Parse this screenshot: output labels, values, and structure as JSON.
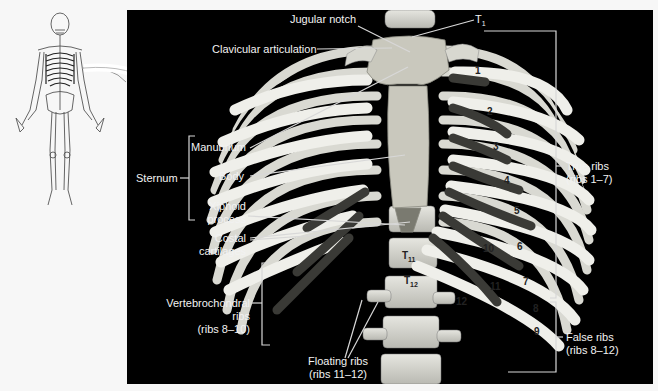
{
  "figure": {
    "panel_bg": "#000000",
    "page_bg": "#f7f7f7",
    "label_color": "#f2f2f2",
    "leader_color": "#d8d8d8"
  },
  "labels": {
    "jugular_notch": "Jugular notch",
    "t1": "T",
    "t1_sub": "1",
    "clavicular_articulation": "Clavicular articulation",
    "sternum": "Sternum",
    "manubrium": "Manubrium",
    "body": "Body",
    "xiphoid_line1": "Xiphoid",
    "xiphoid_line2": "process",
    "costal_line1": "Costal",
    "costal_line2": "cartilages",
    "vertebrochondral_line1": "Vertebrochondral",
    "vertebrochondral_line2": "ribs",
    "vertebrochondral_line3": "(ribs 8–10)",
    "floating_line1": "Floating ribs",
    "floating_line2": "(ribs 11–12)",
    "true_ribs_line1": "True ribs",
    "true_ribs_line2": "(ribs 1–7)",
    "false_ribs_line1": "False ribs",
    "false_ribs_line2": "(ribs 8–12)"
  },
  "rib_numbers": [
    "1",
    "2",
    "3",
    "4",
    "5",
    "6",
    "7",
    "8",
    "9",
    "10",
    "11",
    "12"
  ],
  "vertebrae": {
    "t11": "T",
    "t11_sub": "11",
    "t12": "T",
    "t12_sub": "12"
  },
  "inset": {
    "description": "Full-body skeleton outline with rib cage highlighted; arrow points to detailed view"
  }
}
